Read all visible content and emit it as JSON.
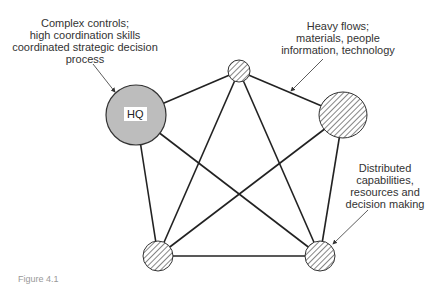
{
  "diagram": {
    "hub_label": "HQ",
    "annotations": {
      "hq": [
        "Complex controls;",
        "high coordination skills",
        "coordinated strategic decision",
        "process"
      ],
      "flows": [
        "Heavy flows;",
        "materials, people",
        "information, technology"
      ],
      "distributed": [
        "Distributed",
        "capabilities,",
        "resources and",
        "decision making"
      ]
    },
    "caption": "Figure 4.1"
  },
  "colors": {
    "hq_fill": "#bdbdbd",
    "line": "#222222",
    "hatch": "#444444"
  }
}
